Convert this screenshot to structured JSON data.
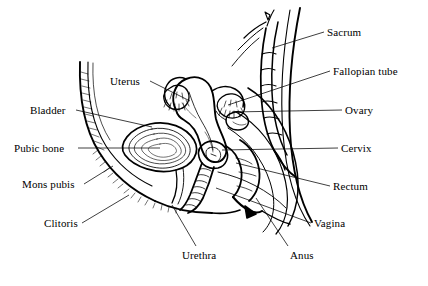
{
  "figure": {
    "type": "anatomical-line-diagram",
    "background_color": "#ffffff",
    "ink_color": "#000000",
    "width": 428,
    "height": 286
  },
  "labels": [
    {
      "id": "uterus",
      "text": "Uterus",
      "side": "left",
      "x": 110,
      "y": 76,
      "leader": {
        "x1": 150,
        "y1": 81,
        "x2": 190,
        "y2": 101
      }
    },
    {
      "id": "bladder",
      "text": "Bladder",
      "side": "left",
      "x": 30,
      "y": 105,
      "leader": {
        "x1": 76,
        "y1": 110,
        "x2": 152,
        "y2": 127
      }
    },
    {
      "id": "pubic-bone",
      "text": "Pubic bone",
      "side": "left",
      "x": 14,
      "y": 143,
      "leader": {
        "x1": 78,
        "y1": 148,
        "x2": 160,
        "y2": 148
      }
    },
    {
      "id": "mons-pubis",
      "text": "Mons pubis",
      "side": "left",
      "x": 22,
      "y": 179,
      "leader": {
        "x1": 84,
        "y1": 184,
        "x2": 113,
        "y2": 166
      }
    },
    {
      "id": "clitoris",
      "text": "Clitoris",
      "side": "left",
      "x": 44,
      "y": 218,
      "leader": {
        "x1": 82,
        "y1": 223,
        "x2": 129,
        "y2": 195
      }
    },
    {
      "id": "urethra",
      "text": "Urethra",
      "side": "left",
      "x": 182,
      "y": 250,
      "leader": {
        "x1": 196,
        "y1": 246,
        "x2": 172,
        "y2": 205
      }
    },
    {
      "id": "sacrum",
      "text": "Sacrum",
      "side": "right",
      "x": 327,
      "y": 27,
      "leader": {
        "x1": 324,
        "y1": 32,
        "x2": 272,
        "y2": 48
      }
    },
    {
      "id": "fallopian-tube",
      "text": "Fallopian tube",
      "side": "right",
      "x": 333,
      "y": 66,
      "leader": {
        "x1": 330,
        "y1": 71,
        "x2": 228,
        "y2": 105
      }
    },
    {
      "id": "ovary",
      "text": "Ovary",
      "side": "right",
      "x": 345,
      "y": 105,
      "leader": {
        "x1": 342,
        "y1": 110,
        "x2": 232,
        "y2": 112
      }
    },
    {
      "id": "cervix",
      "text": "Cervix",
      "side": "right",
      "x": 341,
      "y": 143,
      "leader": {
        "x1": 338,
        "y1": 148,
        "x2": 222,
        "y2": 150
      }
    },
    {
      "id": "rectum",
      "text": "Rectum",
      "side": "right",
      "x": 333,
      "y": 181,
      "leader": {
        "x1": 330,
        "y1": 186,
        "x2": 236,
        "y2": 163
      }
    },
    {
      "id": "vagina",
      "text": "Vagina",
      "side": "right",
      "x": 314,
      "y": 218,
      "leader": {
        "x1": 311,
        "y1": 223,
        "x2": 216,
        "y2": 188
      }
    },
    {
      "id": "anus",
      "text": "Anus",
      "side": "right",
      "x": 290,
      "y": 250,
      "leader": {
        "x1": 288,
        "y1": 246,
        "x2": 256,
        "y2": 198
      }
    }
  ],
  "structures": [
    {
      "id": "abdominal-wall",
      "name": "anterior abdominal wall"
    },
    {
      "id": "bladder-body",
      "name": "urinary bladder"
    },
    {
      "id": "uterus-body",
      "name": "uterus"
    },
    {
      "id": "fallopian-tubes",
      "name": "fallopian tubes with fimbriae"
    },
    {
      "id": "ovary-body",
      "name": "ovary"
    },
    {
      "id": "cervix-body",
      "name": "cervix"
    },
    {
      "id": "vaginal-canal",
      "name": "vaginal canal"
    },
    {
      "id": "rectum-body",
      "name": "rectum"
    },
    {
      "id": "sacrum-spine",
      "name": "sacrum and coccyx vertebrae"
    },
    {
      "id": "buttock-contour",
      "name": "gluteal body contour"
    },
    {
      "id": "perineum",
      "name": "perineum and anal canal"
    }
  ]
}
